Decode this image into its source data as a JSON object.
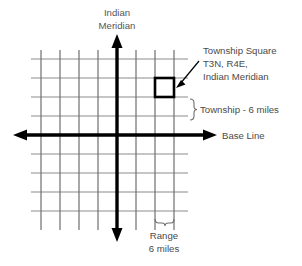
{
  "diagram": {
    "title_label": {
      "line1": "Indian",
      "line2": "Meridian"
    },
    "baseline_label": "Base Line",
    "callout": {
      "line1": "Township Square",
      "line2": "T3N, R4E,",
      "line3": "Indian Meridian"
    },
    "township_bracket_label": "Township - 6 miles",
    "range_bracket_label": {
      "line1": "Range",
      "line2": "6 miles"
    },
    "colors": {
      "background": "#ffffff",
      "grid_vertical": "#6e6e6e",
      "grid_horizontal": "#8c8c8c",
      "axis": "#000000",
      "highlight_square": "#000000",
      "text": "#4a4a4a",
      "bracket": "#6e6e6e"
    },
    "grid": {
      "columns": 9,
      "rows": 9,
      "cell_size_px": 19,
      "unit_miles": 6
    },
    "highlight": {
      "township": "T3N",
      "range": "R4E",
      "meridian": "Indian Meridian"
    }
  }
}
